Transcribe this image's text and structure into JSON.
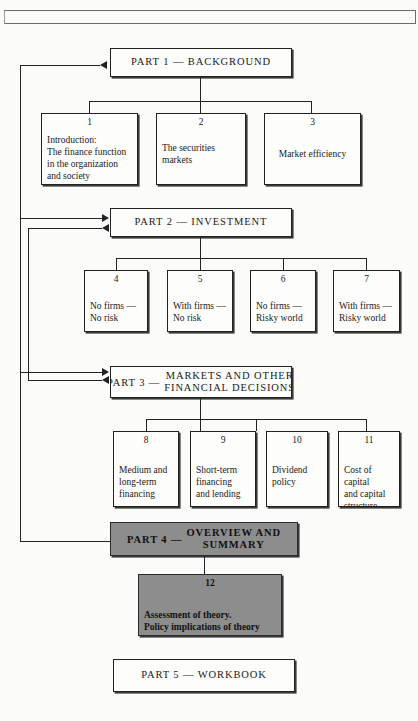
{
  "diagram": {
    "frame_rule": "page-frame-rule"
  },
  "parts": [
    {
      "id": "part1",
      "label": "PART 1 — BACKGROUND",
      "lead": "",
      "stack": [],
      "filled": false
    },
    {
      "id": "part2",
      "label": "PART 2 — INVESTMENT",
      "lead": "",
      "stack": [],
      "filled": false
    },
    {
      "id": "part3",
      "label": "",
      "lead": "PART 3 —",
      "stack": [
        "MARKETS  AND  OTHER",
        "FINANCIAL  DECISIONS"
      ],
      "filled": false
    },
    {
      "id": "part4",
      "label": "",
      "lead": "PART 4 —",
      "stack": [
        "OVERVIEW  AND",
        "SUMMARY"
      ],
      "filled": true
    },
    {
      "id": "part5",
      "label": "PART 5 — WORKBOOK",
      "lead": "",
      "stack": [],
      "filled": false
    }
  ],
  "chapters": {
    "group1": [
      {
        "num": "1",
        "lines": [
          "Introduction:",
          "The finance function",
          "in the organization",
          "and society"
        ]
      },
      {
        "num": "2",
        "lines": [
          "The securities",
          "markets"
        ]
      },
      {
        "num": "3",
        "lines": [
          "Market efficiency"
        ]
      }
    ],
    "group2": [
      {
        "num": "4",
        "lines": [
          "No firms —",
          "No risk"
        ]
      },
      {
        "num": "5",
        "lines": [
          "With firms —",
          "No risk"
        ]
      },
      {
        "num": "6",
        "lines": [
          "No firms    —",
          "Risky world"
        ]
      },
      {
        "num": "7",
        "lines": [
          "With firms —",
          "Risky world"
        ]
      }
    ],
    "group3": [
      {
        "num": "8",
        "lines": [
          "Medium and",
          "long-term",
          "financing"
        ]
      },
      {
        "num": "9",
        "lines": [
          "Short-term",
          "financing",
          "and lending"
        ]
      },
      {
        "num": "10",
        "lines": [
          "Dividend",
          "policy"
        ]
      },
      {
        "num": "11",
        "lines": [
          "Cost of",
          "capital",
          "and capital",
          "structure"
        ]
      }
    ],
    "group4": [
      {
        "num": "12",
        "lines": [
          "Assessment of theory.",
          "Policy implications of theory"
        ]
      }
    ]
  },
  "colors": {
    "page_background": "#fbfbf9",
    "line": "#222222",
    "box_fill": "#fdfdfb",
    "gray_fill": "#8d8d8d",
    "text": "#1a1a1a"
  }
}
